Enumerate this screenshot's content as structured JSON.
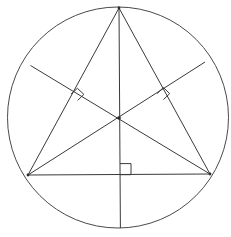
{
  "figure": {
    "canvas": {
      "width": 231,
      "height": 237,
      "background": "#ffffff"
    },
    "style": {
      "stroke_color": "#3a3a3a",
      "circle_stroke_color": "#4a4a4a",
      "stroke_width": 1,
      "fill": "none",
      "point_color": "#2b2b2b"
    }
  },
  "chart_data": {
    "type": "diagram",
    "circle": {
      "name": "circumcircle",
      "center_x": 118.0,
      "center_y": 117.5,
      "radius": 110.5,
      "left_x": 7.5,
      "right_x": 228.5,
      "top_y": 7.0,
      "bottom_y": 228.0
    },
    "points": [
      {
        "id": "A",
        "role": "apex-vertex",
        "x": 119.0,
        "y": 8.0
      },
      {
        "id": "B",
        "role": "bottom-left-vertex",
        "x": 28.0,
        "y": 175.0
      },
      {
        "id": "C",
        "role": "bottom-right-vertex",
        "x": 210.0,
        "y": 174.0
      },
      {
        "id": "H",
        "role": "orthocenter",
        "x": 119.0,
        "y": 118.0
      },
      {
        "id": "Fa",
        "role": "foot-of-altitude-from-A",
        "x": 120.0,
        "y": 174.6
      },
      {
        "id": "Fb",
        "role": "foot-of-altitude-from-B",
        "x": 163.5,
        "y": 98.0
      },
      {
        "id": "Fc",
        "role": "foot-of-altitude-from-C",
        "x": 77.8,
        "y": 99.2
      },
      {
        "id": "Ea",
        "role": "altitude-A-circle-exit",
        "x": 120.4,
        "y": 228.0
      },
      {
        "id": "Eb",
        "role": "altitude-B-circle-exit",
        "x": 205.0,
        "y": 62.0
      },
      {
        "id": "Ec",
        "role": "altitude-C-circle-exit",
        "x": 30.5,
        "y": 65.5
      }
    ],
    "segments": [
      {
        "id": "side-AB",
        "name": "triangle-side-left",
        "from": "A",
        "to": "B"
      },
      {
        "id": "side-AC",
        "name": "triangle-side-right",
        "from": "A",
        "to": "C"
      },
      {
        "id": "side-BC",
        "name": "triangle-side-bottom",
        "from": "B",
        "to": "C"
      },
      {
        "id": "alt-A",
        "name": "altitude-from-apex",
        "from": "A",
        "to": "Ea"
      },
      {
        "id": "alt-B",
        "name": "altitude-from-bottom-left",
        "from": "B",
        "to": "Eb"
      },
      {
        "id": "alt-C",
        "name": "altitude-from-bottom-right",
        "from": "C",
        "to": "Ec"
      }
    ],
    "right_angle_marks": [
      {
        "id": "ra-bottom",
        "at": "Fa",
        "size": 11,
        "orientation": "base-right",
        "x": 120.0,
        "y": 163.5
      },
      {
        "id": "ra-right",
        "at": "Fb",
        "size": 11,
        "orientation": "on-side-AC",
        "x": 163.5,
        "y": 98.0
      },
      {
        "id": "ra-left",
        "at": "Fc",
        "size": 11,
        "orientation": "on-side-AB",
        "x": 77.8,
        "y": 99.2
      }
    ],
    "xlabel": "",
    "ylabel": "",
    "legend": []
  }
}
